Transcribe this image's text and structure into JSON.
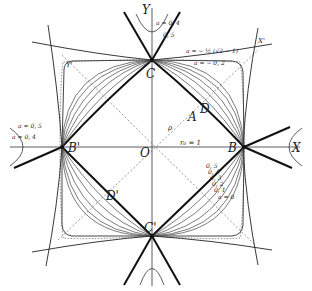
{
  "figure": {
    "colors": {
      "ink": "#222222",
      "background": "#ffffff"
    },
    "axes": {
      "x_label": "X",
      "y_label": "Y",
      "x_prime_label": "X'",
      "y_prime_label": "Y'",
      "origin_label": "O"
    },
    "points": {
      "B": "B",
      "B_prime": "B'",
      "C": "C",
      "C_prime": "C'",
      "D": "D",
      "D_prime": "D'",
      "A": "A"
    },
    "annotations": {
      "rho": "ρ",
      "r0": "r₀ = 1",
      "top_curve_a1": "a = − ½ (√2 − 1)",
      "top_curve_a2": "a = − 0, 2",
      "top_hyperbola_a1": "a = 0, 4",
      "top_hyperbola_a2": "0, 5",
      "left_hyperbola_a1": "a = 0, 5",
      "left_hyperbola_a2": "a = 0, 4",
      "family_labels": [
        "0, 5",
        "0, 4",
        "0, 3",
        "0, 2",
        "0, 1",
        "a = 0"
      ]
    }
  }
}
